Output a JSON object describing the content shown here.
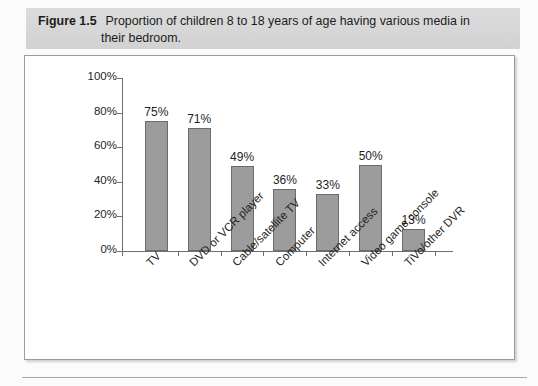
{
  "caption": {
    "figure_number": "Figure 1.5",
    "text_line1": "Proportion of children 8 to 18 years of age having various media in",
    "text_line2": "their bedroom."
  },
  "colors": {
    "bar_fill": "#9c9c9c",
    "bar_border": "#6b6b6b",
    "caption_band": "#d6d6d6",
    "axis": "#6f6f6f",
    "frame_border": "#9b9b9b"
  },
  "chart_data": {
    "type": "bar",
    "title": "Proportion of children 8 to 18 years of age having various media in their bedroom.",
    "categories": [
      "TV",
      "DVD or VCR player",
      "Cable/satellite TV",
      "Computer",
      "Internet access",
      "Video game console",
      "TiVo/other DVR"
    ],
    "values": [
      75,
      71,
      49,
      36,
      33,
      50,
      13
    ],
    "data_labels": [
      "75%",
      "71%",
      "49%",
      "36%",
      "33%",
      "50%",
      "13%"
    ],
    "xlabel": "",
    "ylabel": "",
    "ylim": [
      0,
      100
    ],
    "yticks": [
      0,
      20,
      40,
      60,
      80,
      100
    ],
    "ytick_labels": [
      "0%",
      "20%",
      "40%",
      "60%",
      "80%",
      "100%"
    ],
    "grid": false,
    "legend": false,
    "xtick_label_rotation": -45
  }
}
